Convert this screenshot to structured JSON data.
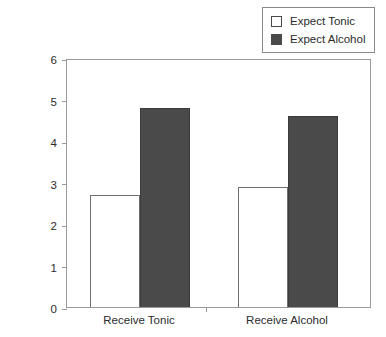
{
  "chart_data": {
    "type": "bar",
    "title": "",
    "xlabel": "",
    "ylabel": "Shock Intensity",
    "ylim": [
      0,
      6
    ],
    "yticks": [
      0,
      1,
      2,
      3,
      4,
      5,
      6
    ],
    "ytick_labels": [
      "0",
      "1",
      "2",
      "3",
      "4",
      "5",
      "6"
    ],
    "grid": false,
    "legend_position": "top-right",
    "categories": [
      "Receive Tonic",
      "Receive Alcohol"
    ],
    "series": [
      {
        "name": "Expect Tonic",
        "values": [
          2.7,
          2.9
        ],
        "color": "#ffffff",
        "edge_color": "#6f6f6f"
      },
      {
        "name": "Expect Alcohol",
        "values": [
          4.8,
          4.6
        ],
        "color": "#4a4a4a",
        "edge_color": "#3a3a3a"
      }
    ]
  },
  "legend": {
    "items": [
      {
        "label": "Expect Tonic",
        "swatch": "open"
      },
      {
        "label": "Expect Alcohol",
        "swatch": "filled"
      }
    ]
  },
  "colors": {
    "bar_fill_dark": "#4a4a4a",
    "bar_fill_light": "#ffffff",
    "frame": "#9a9a9a",
    "text": "#2b2b2b"
  }
}
